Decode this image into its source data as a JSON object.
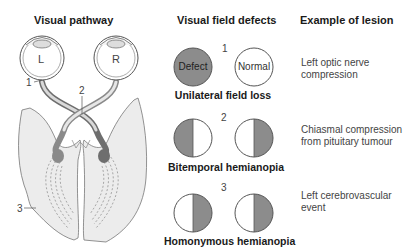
{
  "headers": {
    "pathway": "Visual pathway",
    "defects": "Visual field defects",
    "lesion": "Example of lesion"
  },
  "pathway": {
    "eye_left_label": "L",
    "eye_right_label": "R",
    "markers": [
      "1",
      "2",
      "3"
    ]
  },
  "rows": [
    {
      "number": "1",
      "left_circle_label": "Defect",
      "right_circle_label": "Normal",
      "caption": "Unilateral field loss",
      "lesion_lines": [
        "Left optic nerve",
        "compression"
      ]
    },
    {
      "number": "2",
      "caption": "Bitemporal hemianopia",
      "lesion_lines": [
        "Chiasmal compression",
        "from pituitary tumour"
      ]
    },
    {
      "number": "3",
      "caption": "Homonymous hemianopia",
      "lesion_lines": [
        "Left cerebrovascular",
        "event"
      ]
    }
  ],
  "colors": {
    "defect_fill": "#8c8c8c",
    "outline": "#555555",
    "nerve_dark": "#6e6e6e",
    "nerve_light": "#d9d9d9",
    "cortex_fill": "#ececec"
  }
}
